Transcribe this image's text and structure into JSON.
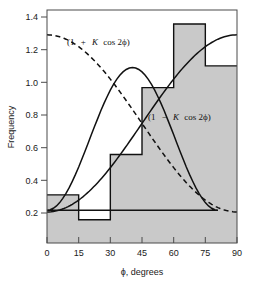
{
  "chart_data": {
    "type": "bar",
    "title": "",
    "xlabel": "ϕ, degrees",
    "ylabel": "Frequency",
    "xlim": [
      0,
      90
    ],
    "ylim": [
      0,
      1.5
    ],
    "grid": false,
    "legend_position": "inline-annotations",
    "xticks": [
      "0",
      "15",
      "30",
      "45",
      "60",
      "75",
      "90"
    ],
    "xtick_values": [
      0,
      15,
      30,
      45,
      60,
      75,
      90
    ],
    "yticks": [
      "0.2",
      "0.4",
      "0.6",
      "0.8",
      "1.0",
      "1.2",
      "1.4"
    ],
    "ytick_values": [
      0.2,
      0.4,
      0.6,
      0.8,
      1.0,
      1.2,
      1.4
    ],
    "bin_edges": [
      0,
      15,
      30,
      45,
      60,
      75,
      90
    ],
    "categories": [
      "0-15",
      "15-30",
      "30-45",
      "45-60",
      "60-75",
      "75-90"
    ],
    "values": [
      0.31,
      0.15,
      0.57,
      1.0,
      1.41,
      1.14
    ],
    "series": [
      {
        "name": "(1 + K cos 2ϕ)",
        "style": "dashed",
        "K": 0.57,
        "x": [
          0,
          15,
          30,
          45,
          60,
          75,
          90
        ],
        "values": [
          1.34,
          1.2,
          0.86,
          0.77,
          0.72,
          0.8,
          0.19
        ]
      },
      {
        "name": "(1 − K cos 2ϕ)",
        "style": "solid",
        "K": 0.57,
        "x": [
          0,
          15,
          30,
          45,
          60,
          75,
          90
        ],
        "values": [
          0.2,
          0.34,
          0.68,
          0.77,
          1.05,
          1.2,
          1.34
        ]
      }
    ],
    "annotations": [
      {
        "text": "(1  +  K cos 2ϕ)",
        "x": 18,
        "y": 1.3,
        "series": "dashed"
      },
      {
        "text": "(1  −  K cos 2ϕ)",
        "x": 48,
        "y": 0.86,
        "series": "solid"
      }
    ],
    "colors": {
      "bar_fill": "#c9c9c9",
      "bar_outline": "#111111",
      "curve": "#111111",
      "frame": "#4a4a4a",
      "text": "#1a1a1a",
      "background": "#ffffff"
    }
  },
  "annotation_parts": {
    "upper": {
      "open": "(1",
      "op": "+",
      "k": "K",
      "tail": "cos 2ϕ)"
    },
    "lower": {
      "open": "(1",
      "op": "−",
      "k": "K",
      "tail": "cos 2ϕ)"
    }
  },
  "axis": {
    "x_title": "ϕ, degrees",
    "y_title": "Frequency"
  }
}
